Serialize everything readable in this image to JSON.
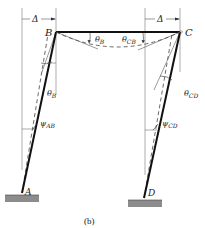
{
  "figure": {
    "caption": "(b)",
    "colors": {
      "line": "#111111",
      "thin": "#666666",
      "ground": "#8c8c8c"
    },
    "nodes": {
      "A": {
        "label": "A"
      },
      "B": {
        "label": "B"
      },
      "C": {
        "label": "C"
      },
      "D": {
        "label": "D"
      }
    },
    "displacements": {
      "left": {
        "symbol": "Δ"
      },
      "right": {
        "symbol": "Δ"
      }
    },
    "angles": {
      "theta_B_beam": {
        "base": "θ",
        "sub": "B"
      },
      "theta_CB": {
        "base": "θ",
        "sub": "CB"
      },
      "theta_B_column": {
        "base": "θ",
        "sub": "B"
      },
      "theta_CD": {
        "base": "θ",
        "sub": "CD"
      },
      "psi_AB": {
        "base": "ψ",
        "sub": "AB"
      },
      "psi_CD": {
        "base": "ψ",
        "sub": "CD"
      }
    }
  }
}
